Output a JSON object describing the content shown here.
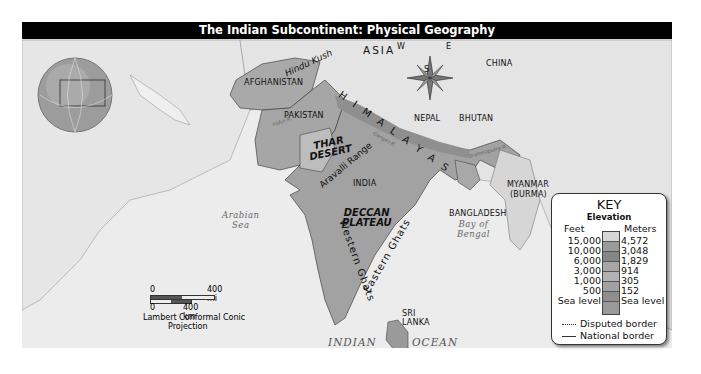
{
  "title": "The Indian Subcontinent: Physical Geography",
  "labels": {
    "continent": "ASIA",
    "countries": {
      "afghanistan": "AFGHANISTAN",
      "pakistan": "PAKISTAN",
      "india": "INDIA",
      "nepal": "NEPAL",
      "bhutan": "BHUTAN",
      "china": "CHINA",
      "bangladesh": "BANGLADESH",
      "myanmar_line1": "MYANMAR",
      "myanmar_line2": "(BURMA)",
      "sri_lanka_line1": "SRI",
      "sri_lanka_line2": "LANKA"
    },
    "regions": {
      "thar_line1": "THAR",
      "thar_line2": "DESERT",
      "deccan_line1": "DECCAN",
      "deccan_line2": "PLATEAU"
    },
    "ranges": {
      "hindu_kush": "Hindu Kush",
      "himalayas": "H I M A L A Y A S",
      "aravalli": "Aravalli Range",
      "western_ghats": "Western Ghats",
      "eastern_ghats": "Eastern Ghats"
    },
    "rivers": {
      "indus": "Indus R.",
      "ganges": "Ganges R.",
      "brahmaputra": "Brahmaputra R."
    },
    "water": {
      "arabian_line1": "Arabian",
      "arabian_line2": "Sea",
      "bengal_line1": "Bay of",
      "bengal_line2": "Bengal",
      "indian": "INDIAN",
      "ocean": "OCEAN"
    }
  },
  "compass": {
    "n": "N",
    "s": "S",
    "e": "E",
    "w": "W"
  },
  "scale": {
    "mi_zero": "0",
    "mi_value": "400 mi",
    "km_zero": "0",
    "km_value": "400 km",
    "projection_line1": "Lambert Conformal Conic",
    "projection_line2": "Projection"
  },
  "key": {
    "title": "KEY",
    "subtitle": "Elevation",
    "feet_header": "Feet",
    "meters_header": "Meters",
    "rows": [
      {
        "feet": "15,000",
        "meters": "4,572",
        "color": "#d6d6d6"
      },
      {
        "feet": "10,000",
        "meters": "3,048",
        "color": "#9a9a9a"
      },
      {
        "feet": "6,000",
        "meters": "1,829",
        "color": "#8a8a8a"
      },
      {
        "feet": "3,000",
        "meters": "914",
        "color": "#a8a8a8"
      },
      {
        "feet": "1,000",
        "meters": "305",
        "color": "#b0b0b0"
      },
      {
        "feet": "500",
        "meters": "152",
        "color": "#a0a0a0"
      },
      {
        "feet": "Sea level",
        "meters": "Sea level",
        "color": "#8e8e8e"
      }
    ],
    "lowest_color": "#999999",
    "disputed_border": "Disputed border",
    "national_border": "National border"
  }
}
